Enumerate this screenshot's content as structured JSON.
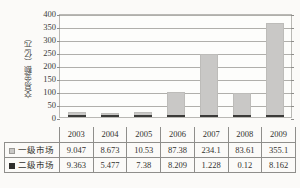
{
  "chart_data": {
    "type": "bar",
    "stacked": true,
    "title": "",
    "xlabel": "",
    "ylabel": "交易金额（亿元）",
    "ylim": [
      0,
      400
    ],
    "ytick_step": 50,
    "yticks": [
      "400",
      "350",
      "300",
      "250",
      "200",
      "150",
      "100",
      "50",
      "0"
    ],
    "grid": "horizontal",
    "legend_position": "table-left",
    "categories": [
      "2003",
      "2004",
      "2005",
      "2006",
      "2007",
      "2008",
      "2009"
    ],
    "series": [
      {
        "name": "一级市场",
        "swatch": "primary",
        "color": "#c9c8c6",
        "values": [
          9.047,
          8.673,
          10.53,
          87.38,
          234.1,
          83.61,
          355.1
        ],
        "labels": [
          "9.047",
          "8.673",
          "10.53",
          "87.38",
          "234.1",
          "83.61",
          "355.1"
        ]
      },
      {
        "name": "二级市场",
        "swatch": "secondary",
        "color": "#3b3b39",
        "values": [
          9.363,
          5.477,
          7.38,
          8.209,
          1.228,
          0.12,
          8.162
        ],
        "labels": [
          "9.363",
          "5.477",
          "7.38",
          "8.209",
          "1.228",
          "0.12",
          "8.162"
        ]
      }
    ]
  },
  "table": {
    "corner_label": "",
    "header": [
      "2003",
      "2004",
      "2005",
      "2006",
      "2007",
      "2008",
      "2009"
    ],
    "rows": [
      {
        "label": "一级市场",
        "swatch": "primary",
        "cells": [
          "9.047",
          "8.673",
          "10.53",
          "87.38",
          "234.1",
          "83.61",
          "355.1"
        ]
      },
      {
        "label": "二级市场",
        "swatch": "secondary",
        "cells": [
          "9.363",
          "5.477",
          "7.38",
          "8.209",
          "1.228",
          "0.12",
          "8.162"
        ]
      }
    ]
  },
  "colors": {
    "primary_series": "#c9c8c6",
    "secondary_series": "#3b3b39",
    "gridline": "#b0afab",
    "border": "#8f8e8b",
    "background": "#fbfaf8"
  }
}
